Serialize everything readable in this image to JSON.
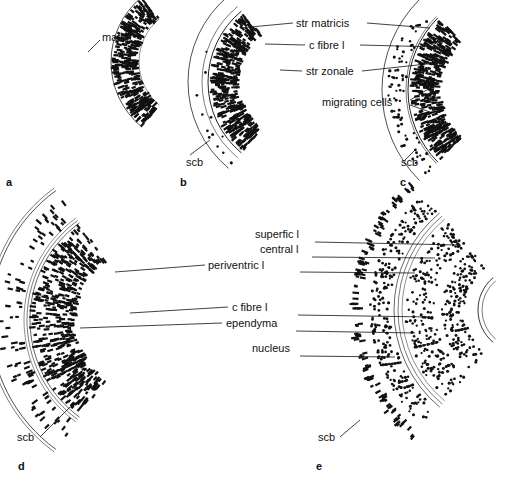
{
  "figure": {
    "panels": [
      {
        "id": "a",
        "labels": [
          {
            "text": "matrix",
            "x": 102,
            "y": 37
          }
        ]
      },
      {
        "id": "b",
        "labels": [
          {
            "text": "str matricis",
            "x": 296,
            "y": 23
          },
          {
            "text": "c fibre l",
            "x": 309,
            "y": 45
          },
          {
            "text": "str zonale",
            "x": 306,
            "y": 71
          },
          {
            "text": "scb",
            "x": 186,
            "y": 162
          }
        ]
      },
      {
        "id": "c",
        "labels": [
          {
            "text": "migrating cells",
            "x": 322,
            "y": 102
          },
          {
            "text": "scb",
            "x": 401,
            "y": 162
          }
        ]
      },
      {
        "id": "d",
        "labels": [
          {
            "text": "periventric l",
            "x": 208,
            "y": 265
          },
          {
            "text": "c fibre l",
            "x": 232,
            "y": 307
          },
          {
            "text": "ependyma",
            "x": 226,
            "y": 323
          },
          {
            "text": "scb",
            "x": 17,
            "y": 437
          }
        ]
      },
      {
        "id": "e",
        "labels": [
          {
            "text": "superfic l",
            "x": 255,
            "y": 234
          },
          {
            "text": "central l",
            "x": 260,
            "y": 249
          },
          {
            "text": "nucleus",
            "x": 252,
            "y": 348
          },
          {
            "text": "scb",
            "x": 318,
            "y": 437
          }
        ]
      }
    ],
    "panel_letters": {
      "a": "a",
      "b": "b",
      "c": "c",
      "d": "d",
      "e": "e"
    }
  }
}
